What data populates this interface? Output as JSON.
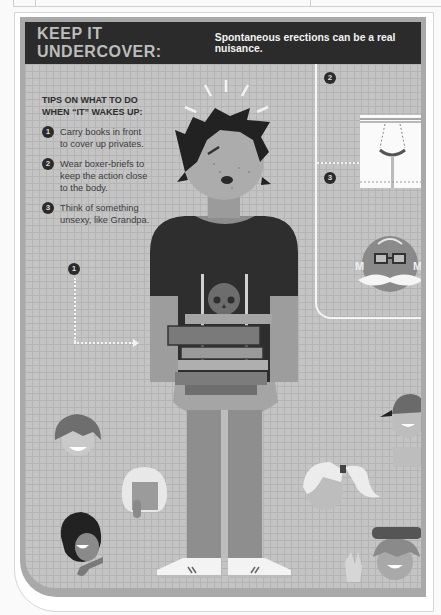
{
  "header": {
    "title": "KEEP IT UNDERCOVER:",
    "subtitle": "Spontaneous erections can be a real nuisance."
  },
  "tips": {
    "heading_line1": "TIPS ON WHAT TO DO",
    "heading_line2": "WHEN “IT” WAKES UP:",
    "items": [
      {
        "number": "1",
        "line1": "Carry books in front",
        "line2": "to cover up privates."
      },
      {
        "number": "2",
        "line1": "Wear boxer-briefs to",
        "line2": "keep the action close",
        "line3": "to the body."
      },
      {
        "number": "3",
        "line1": "Think of something",
        "line2": "unsexy, like Grandpa."
      }
    ]
  },
  "callouts": {
    "books": "1",
    "boxers": "2",
    "grandpa": "3"
  },
  "colors": {
    "header_bg": "#2b2b2b",
    "panel_bg": "#c4c4c4",
    "frame": "#a9a9a9",
    "shirt": "#2e2e2e",
    "skin": "#9a9a9a"
  }
}
